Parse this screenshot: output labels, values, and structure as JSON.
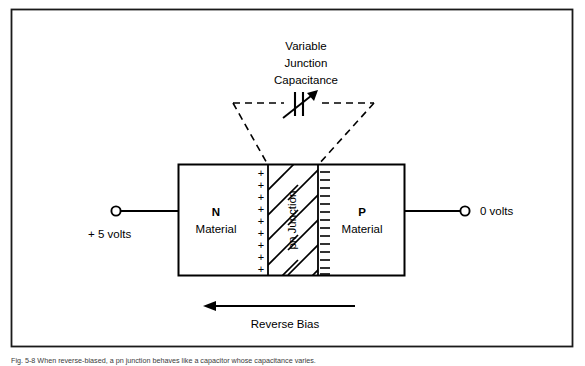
{
  "figure": {
    "border_color": "#1a1a1a",
    "background": "#ffffff",
    "ink_color": "#000000",
    "caption": "Fig. 5-8 When reverse-biased, a pn junction behaves like a capacitor whose capacitance varies."
  },
  "callout": {
    "title_line1": "Variable",
    "title_line2": "Junction",
    "title_line3": "Capacitance",
    "symbol_name": "variable-capacitor-symbol"
  },
  "device": {
    "n_region": {
      "type_label": "N",
      "material_label": "Material"
    },
    "p_region": {
      "type_label": "P",
      "material_label": "Material"
    },
    "junction": {
      "label": "pn Junction",
      "positive_charge_glyph": "+",
      "negative_charge_glyph": "–",
      "positive_charge_count": 9,
      "negative_charge_count": 14
    }
  },
  "terminals": {
    "left": {
      "label": "+ 5 volts",
      "node_name": "left-terminal-node"
    },
    "right": {
      "label": "0 volts",
      "node_name": "right-terminal-node"
    }
  },
  "bias": {
    "label": "Reverse Bias",
    "direction": "left"
  }
}
